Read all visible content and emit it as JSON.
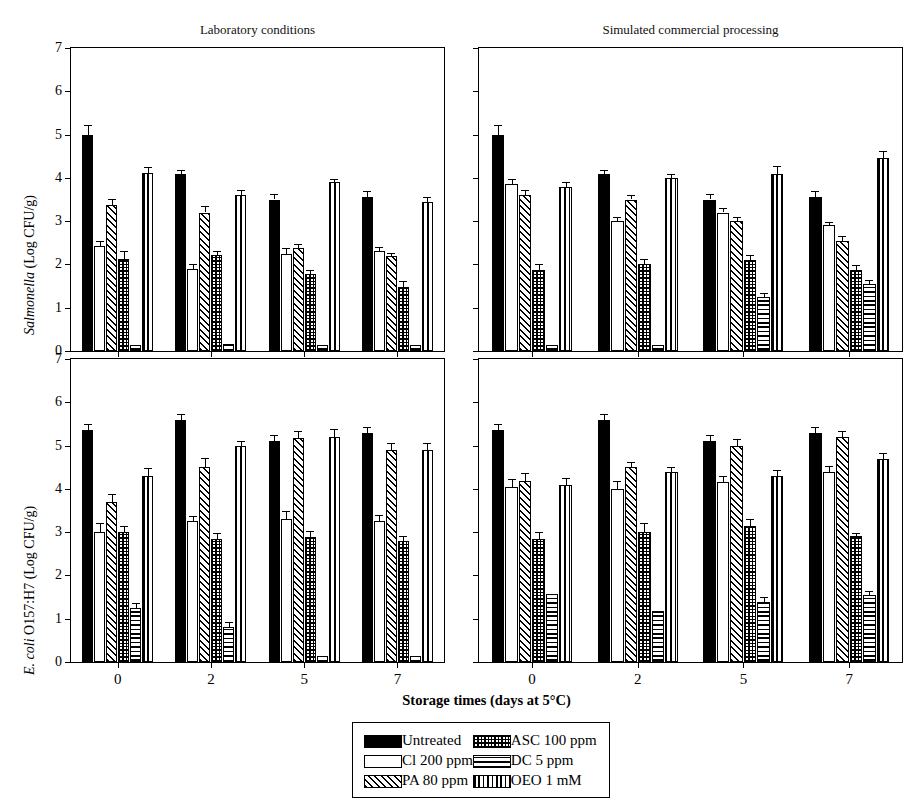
{
  "figure": {
    "axis_title": "Storage times (days at 5°C)",
    "panel_titles": {
      "left": "Laboratory conditions",
      "right": "Simulated commercial processing"
    },
    "ylabels": {
      "top": "Salmonella (Log CFU/g)",
      "bottom": "E. coli O157:H7 (Log CFU/g)"
    }
  },
  "legend": {
    "items": [
      {
        "label": "Untreated",
        "pattern": "solid"
      },
      {
        "label": "ASC 100 ppm",
        "pattern": "check"
      },
      {
        "label": "Cl 200 ppm",
        "pattern": "white"
      },
      {
        "label": "DC 5 ppm",
        "pattern": "horiz"
      },
      {
        "label": "PA 80 ppm",
        "pattern": "diag"
      },
      {
        "label": "OEO 1 mM",
        "pattern": "vert"
      }
    ]
  },
  "chart_data": {
    "type": "bar",
    "xlabel": "Storage times (days at 5°C)",
    "ylabel": "Log CFU/g",
    "ylim": [
      0,
      7
    ],
    "yticks": [
      0,
      1,
      2,
      3,
      4,
      5,
      6,
      7
    ],
    "categories": [
      "0",
      "2",
      "5",
      "7"
    ],
    "grid": false,
    "legend_position": "bottom-center",
    "series_names": [
      "Untreated",
      "Cl 200 ppm",
      "PA 80 ppm",
      "ASC 100 ppm",
      "DC 5 ppm",
      "OEO 1 mM"
    ],
    "panels": [
      {
        "id": "salmonella-laboratory",
        "row": 0,
        "col": 0,
        "organism": "Salmonella",
        "condition": "Laboratory conditions",
        "series": [
          {
            "name": "Untreated",
            "pattern": "solid",
            "values": [
              5.0,
              4.1,
              3.5,
              3.55
            ],
            "errors": [
              0.22,
              0.08,
              0.12,
              0.15
            ]
          },
          {
            "name": "Cl 200 ppm",
            "pattern": "white",
            "values": [
              2.42,
              1.9,
              2.25,
              2.3
            ],
            "errors": [
              0.13,
              0.1,
              0.13,
              0.1
            ]
          },
          {
            "name": "PA 80 ppm",
            "pattern": "diag",
            "values": [
              3.38,
              3.2,
              2.38,
              2.2
            ],
            "errors": [
              0.13,
              0.14,
              0.1,
              0.07
            ]
          },
          {
            "name": "ASC 100 ppm",
            "pattern": "check",
            "values": [
              2.12,
              2.22,
              1.78,
              1.48
            ],
            "errors": [
              0.18,
              0.1,
              0.1,
              0.13
            ]
          },
          {
            "name": "DC 5 ppm",
            "pattern": "horiz",
            "values": [
              0.15,
              0.16,
              0.15,
              0.15
            ],
            "errors": [
              0.0,
              0.0,
              0.0,
              0.0
            ]
          },
          {
            "name": "OEO 1 mM",
            "pattern": "vert",
            "values": [
              4.12,
              3.6,
              3.9,
              3.45
            ],
            "errors": [
              0.13,
              0.13,
              0.08,
              0.1
            ]
          }
        ]
      },
      {
        "id": "salmonella-commercial",
        "row": 0,
        "col": 1,
        "organism": "Salmonella",
        "condition": "Simulated commercial processing",
        "series": [
          {
            "name": "Untreated",
            "pattern": "solid",
            "values": [
              5.0,
              4.1,
              3.5,
              3.55
            ],
            "errors": [
              0.22,
              0.08,
              0.12,
              0.15
            ]
          },
          {
            "name": "Cl 200 ppm",
            "pattern": "white",
            "values": [
              3.85,
              3.0,
              3.2,
              2.9
            ],
            "errors": [
              0.12,
              0.1,
              0.1,
              0.08
            ]
          },
          {
            "name": "PA 80 ppm",
            "pattern": "diag",
            "values": [
              3.6,
              3.5,
              3.0,
              2.55
            ],
            "errors": [
              0.12,
              0.1,
              0.1,
              0.1
            ]
          },
          {
            "name": "ASC 100 ppm",
            "pattern": "check",
            "values": [
              1.88,
              2.0,
              2.1,
              1.88
            ],
            "errors": [
              0.12,
              0.12,
              0.12,
              0.1
            ]
          },
          {
            "name": "DC 5 ppm",
            "pattern": "horiz",
            "values": [
              0.15,
              0.15,
              1.25,
              1.55
            ],
            "errors": [
              0.0,
              0.0,
              0.1,
              0.1
            ]
          },
          {
            "name": "OEO 1 mM",
            "pattern": "vert",
            "values": [
              3.8,
              4.0,
              4.1,
              4.45
            ],
            "errors": [
              0.1,
              0.1,
              0.18,
              0.18
            ]
          }
        ]
      },
      {
        "id": "ecoli-laboratory",
        "row": 1,
        "col": 0,
        "organism": "E. coli O157:H7",
        "condition": "Laboratory conditions",
        "series": [
          {
            "name": "Untreated",
            "pattern": "solid",
            "values": [
              5.35,
              5.6,
              5.1,
              5.3
            ],
            "errors": [
              0.15,
              0.13,
              0.15,
              0.13
            ]
          },
          {
            "name": "Cl 200 ppm",
            "pattern": "white",
            "values": [
              3.0,
              3.25,
              3.3,
              3.25
            ],
            "errors": [
              0.2,
              0.13,
              0.18,
              0.15
            ]
          },
          {
            "name": "PA 80 ppm",
            "pattern": "diag",
            "values": [
              3.7,
              4.5,
              5.18,
              4.9
            ],
            "errors": [
              0.18,
              0.22,
              0.15,
              0.15
            ]
          },
          {
            "name": "ASC 100 ppm",
            "pattern": "check",
            "values": [
              3.0,
              2.85,
              2.88,
              2.8
            ],
            "errors": [
              0.15,
              0.13,
              0.15,
              0.1
            ]
          },
          {
            "name": "DC 5 ppm",
            "pattern": "horiz",
            "values": [
              1.25,
              0.8,
              0.15,
              0.15
            ],
            "errors": [
              0.12,
              0.12,
              0.0,
              0.0
            ]
          },
          {
            "name": "OEO 1 mM",
            "pattern": "vert",
            "values": [
              4.3,
              4.98,
              5.2,
              4.9
            ],
            "errors": [
              0.18,
              0.12,
              0.18,
              0.15
            ]
          }
        ]
      },
      {
        "id": "ecoli-commercial",
        "row": 1,
        "col": 1,
        "organism": "E. coli O157:H7",
        "condition": "Simulated commercial processing",
        "series": [
          {
            "name": "Untreated",
            "pattern": "solid",
            "values": [
              5.35,
              5.6,
              5.1,
              5.3
            ],
            "errors": [
              0.15,
              0.13,
              0.15,
              0.13
            ]
          },
          {
            "name": "Cl 200 ppm",
            "pattern": "white",
            "values": [
              4.05,
              4.0,
              4.15,
              4.38
            ],
            "errors": [
              0.18,
              0.18,
              0.15,
              0.15
            ]
          },
          {
            "name": "PA 80 ppm",
            "pattern": "diag",
            "values": [
              4.18,
              4.5,
              5.0,
              5.2
            ],
            "errors": [
              0.18,
              0.13,
              0.15,
              0.13
            ]
          },
          {
            "name": "ASC 100 ppm",
            "pattern": "check",
            "values": [
              2.85,
              3.0,
              3.15,
              2.9
            ],
            "errors": [
              0.15,
              0.22,
              0.15,
              0.08
            ]
          },
          {
            "name": "DC 5 ppm",
            "pattern": "horiz",
            "values": [
              1.58,
              1.18,
              1.38,
              1.55
            ],
            "errors": [
              0.0,
              0.0,
              0.12,
              0.1
            ]
          },
          {
            "name": "OEO 1 mM",
            "pattern": "vert",
            "values": [
              4.1,
              4.38,
              4.3,
              4.7
            ],
            "errors": [
              0.15,
              0.13,
              0.13,
              0.13
            ]
          }
        ]
      }
    ]
  }
}
